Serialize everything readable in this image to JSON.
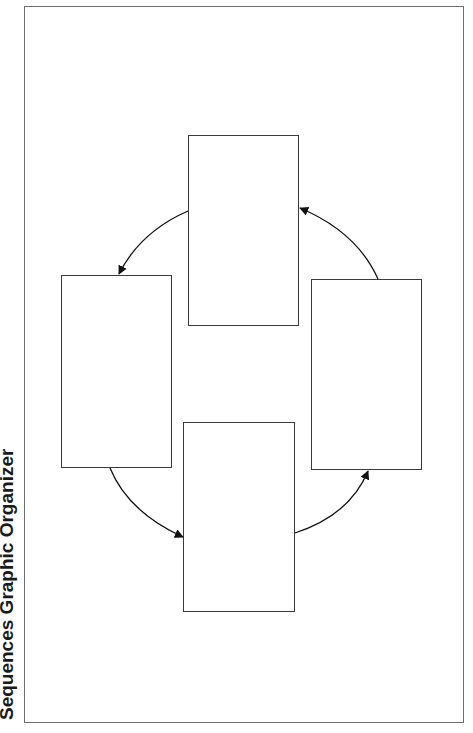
{
  "title": "Sequences Graphic Organizer",
  "colors": {
    "frame_border": "#6e6e6e",
    "box_border": "#3a3a3a",
    "arrow": "#111111",
    "background": "#ffffff"
  },
  "boxes": [
    {
      "id": "top",
      "label": "",
      "x": 188,
      "y": 135,
      "w": 111,
      "h": 191
    },
    {
      "id": "left",
      "label": "",
      "x": 61,
      "y": 275,
      "w": 111,
      "h": 193
    },
    {
      "id": "bottom",
      "label": "",
      "x": 183,
      "y": 422,
      "w": 112,
      "h": 190
    },
    {
      "id": "right",
      "label": "",
      "x": 311,
      "y": 279,
      "w": 111,
      "h": 191
    }
  ],
  "arrows": [
    {
      "from": "top",
      "to": "left",
      "direction": "counter-clockwise"
    },
    {
      "from": "left",
      "to": "bottom",
      "direction": "counter-clockwise"
    },
    {
      "from": "bottom",
      "to": "right",
      "direction": "counter-clockwise"
    },
    {
      "from": "right",
      "to": "top",
      "direction": "counter-clockwise"
    }
  ]
}
